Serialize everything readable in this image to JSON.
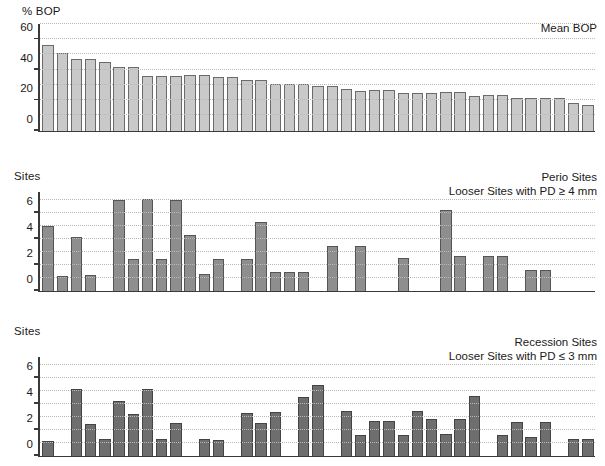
{
  "figure": {
    "background": "#ffffff",
    "panel_count": 3
  },
  "chart_data": [
    {
      "type": "bar",
      "id": "mean-bop",
      "title": "Mean BOP",
      "title_lines": [
        "Mean BOP",
        ""
      ],
      "ylabel": "% BOP",
      "xlabel": "",
      "ylim": [
        0,
        70
      ],
      "yticks": [
        0,
        20,
        40,
        60
      ],
      "ytick_labels": [
        "0",
        "20",
        "40",
        "60"
      ],
      "gridlines": [
        10,
        20,
        30,
        40,
        50,
        60,
        70
      ],
      "grid": true,
      "legend": "none",
      "bar_color": "#c9c9c9",
      "bar_edge_color": "#6b6b6b",
      "categories": [
        "1",
        "2",
        "3",
        "4",
        "5",
        "6",
        "7",
        "8",
        "9",
        "10",
        "11",
        "12",
        "13",
        "14",
        "15",
        "16",
        "17",
        "18",
        "19",
        "20",
        "21",
        "22",
        "23",
        "24",
        "25",
        "26",
        "27",
        "28",
        "29",
        "30",
        "31",
        "32",
        "33",
        "34"
      ],
      "values": [
        56,
        51,
        47,
        47,
        45,
        41.5,
        41.5,
        36,
        36,
        36,
        36.5,
        36.5,
        35,
        35,
        33,
        33,
        30.5,
        30.5,
        30.5,
        29,
        29,
        27.5,
        26,
        26.5,
        26.5,
        24.5,
        24.5,
        24.5,
        25,
        25,
        23,
        23.5,
        23.5,
        21.5,
        21.5,
        21.5,
        21.5,
        18,
        17
      ]
    },
    {
      "type": "bar",
      "id": "perio-sites",
      "title": "Perio Sites",
      "title_lines": [
        "Perio Sites",
        "Looser Sites with PD ≥ 4 mm"
      ],
      "ylabel": "Sites",
      "xlabel": "",
      "ylim": [
        0,
        7.6
      ],
      "yticks": [
        0,
        2,
        4,
        6
      ],
      "ytick_labels": [
        "0",
        "2",
        "4",
        "6"
      ],
      "gridlines": [
        1,
        2,
        3,
        4,
        5,
        6,
        7
      ],
      "grid": true,
      "legend": "none",
      "bar_color": "#8e8e8e",
      "bar_edge_color": "#555555",
      "categories": [
        "1",
        "2",
        "3",
        "4",
        "5",
        "6",
        "7",
        "8",
        "9",
        "10",
        "11",
        "12",
        "13",
        "14",
        "15",
        "16",
        "17",
        "18",
        "19",
        "20",
        "21",
        "22",
        "23",
        "24",
        "25",
        "26",
        "27",
        "28",
        "29",
        "30",
        "31",
        "32",
        "33",
        "34",
        "35",
        "36",
        "37",
        "38",
        "39"
      ],
      "values": [
        5.0,
        1.1,
        4.1,
        1.2,
        0,
        7.0,
        2.45,
        7.05,
        2.4,
        7.0,
        4.25,
        1.3,
        2.45,
        0,
        2.45,
        5.3,
        1.4,
        1.4,
        1.4,
        0,
        3.45,
        0,
        3.4,
        0,
        0,
        2.5,
        0,
        0,
        6.25,
        2.7,
        0,
        2.7,
        2.7,
        0,
        1.6,
        1.6,
        0,
        0,
        0
      ]
    },
    {
      "type": "bar",
      "id": "recession-sites",
      "title": "Recession Sites",
      "title_lines": [
        "Recession Sites",
        "Looser Sites with PD ≤ 3 mm"
      ],
      "ylabel": "Sites",
      "xlabel": "",
      "ylim": [
        0,
        7.6
      ],
      "yticks": [
        0,
        2,
        4,
        6
      ],
      "ytick_labels": [
        "0",
        "2",
        "4",
        "6"
      ],
      "gridlines": [
        1,
        2,
        3,
        4,
        5,
        6,
        7
      ],
      "grid": true,
      "legend": "none",
      "bar_color": "#6e6e6e",
      "bar_edge_color": "#444444",
      "categories": [
        "1",
        "2",
        "3",
        "4",
        "5",
        "6",
        "7",
        "8",
        "9",
        "10",
        "11",
        "12",
        "13",
        "14",
        "15",
        "16",
        "17",
        "18",
        "19",
        "20",
        "21",
        "22",
        "23",
        "24",
        "25",
        "26",
        "27",
        "28",
        "29",
        "30",
        "31",
        "32",
        "33",
        "34",
        "35",
        "36",
        "37",
        "38",
        "39"
      ],
      "values": [
        1.1,
        0,
        5.15,
        2.45,
        1.25,
        4.2,
        3.2,
        5.15,
        1.3,
        2.5,
        0,
        1.25,
        1.2,
        0,
        3.3,
        2.5,
        3.35,
        0,
        4.5,
        5.45,
        0,
        3.4,
        1.55,
        2.65,
        2.65,
        1.6,
        3.45,
        2.8,
        1.65,
        2.8,
        4.6,
        0,
        1.6,
        2.55,
        1.4,
        2.6,
        0,
        1.25,
        1.25
      ]
    }
  ]
}
